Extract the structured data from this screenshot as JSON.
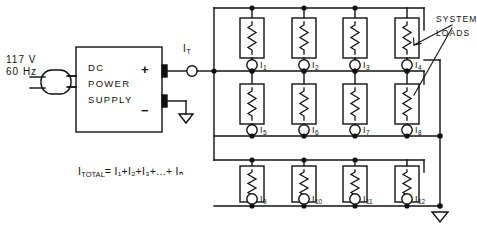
{
  "figure": {
    "type": "electrical-schematic",
    "caption": ""
  },
  "source": {
    "voltage": "117 V",
    "frequency": "60 Hz",
    "plug_icon": "ac-plug-icon"
  },
  "power_supply": {
    "line1": "DC",
    "line2": "POWER",
    "line3": "SUPPLY",
    "positive_terminal": "+",
    "negative_terminal": "−",
    "ground_icon": "ground-icon"
  },
  "total_current": {
    "symbol": "I",
    "subscript": "T",
    "meter_icon": "ammeter-icon"
  },
  "annotation": {
    "line1": "SYSTEM",
    "line2": "LOADS",
    "leader_icon": "leader-line-icon"
  },
  "formula": {
    "lhs_main": "I",
    "lhs_sub": "TOTAL",
    "rhs": "= I₁+I₂+I₃+...+ Iₙ",
    "plain": "I_TOTAL = I1+I2+I3+...+ IN"
  },
  "loads": {
    "rows": [
      {
        "row": 1,
        "meters": [
          {
            "main": "I",
            "sub": "1"
          },
          {
            "main": "I",
            "sub": "2"
          },
          {
            "main": "I",
            "sub": "3"
          },
          {
            "main": "I",
            "sub": "4"
          }
        ]
      },
      {
        "row": 2,
        "meters": [
          {
            "main": "I",
            "sub": "5"
          },
          {
            "main": "I",
            "sub": "6"
          },
          {
            "main": "I",
            "sub": "7"
          },
          {
            "main": "I",
            "sub": "8"
          }
        ]
      },
      {
        "row": 3,
        "meters": [
          {
            "main": "I",
            "sub": "9"
          },
          {
            "main": "I",
            "sub": "10"
          },
          {
            "main": "I",
            "sub": "11"
          },
          {
            "main": "I",
            "sub": "12"
          }
        ]
      }
    ],
    "load_icon": "resistor-icon",
    "meter_icon": "ammeter-icon",
    "count": 12
  },
  "colors": {
    "ink": "#111111",
    "background": "#ffffff"
  }
}
